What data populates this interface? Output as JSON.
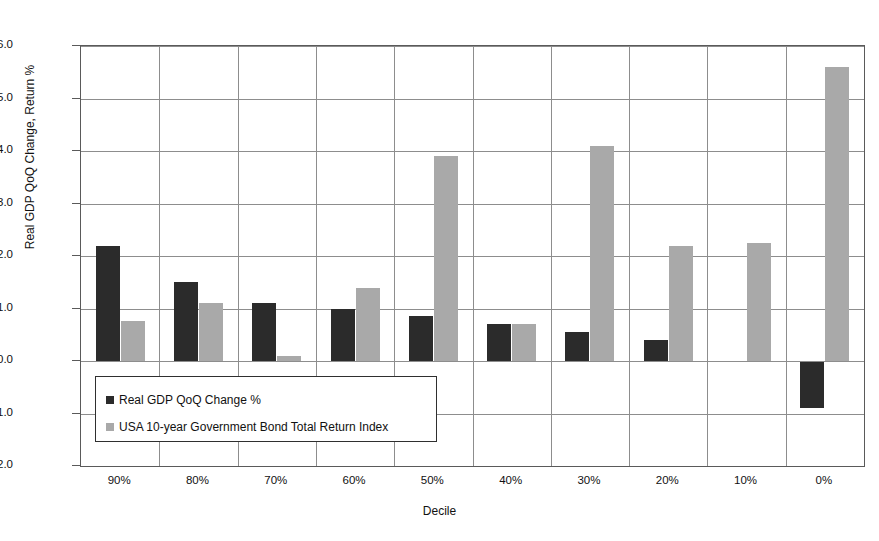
{
  "chart_data": {
    "type": "bar",
    "title": "",
    "xlabel": "Decile",
    "ylabel": "Real GDP QoQ Change, Return %",
    "categories": [
      "90%",
      "80%",
      "70%",
      "60%",
      "50%",
      "40%",
      "30%",
      "20%",
      "10%",
      "0%"
    ],
    "series": [
      {
        "name": "Real GDP QoQ Change %",
        "color": "#2b2b2b",
        "values": [
          2.2,
          1.5,
          1.1,
          1.0,
          0.85,
          0.7,
          0.55,
          0.4,
          0.0,
          -0.9
        ]
      },
      {
        "name": "USA 10-year Government Bond Total Return Index",
        "color": "#a9a9a9",
        "values": [
          0.77,
          1.1,
          0.1,
          1.4,
          3.9,
          0.7,
          4.1,
          2.2,
          2.25,
          5.6
        ]
      }
    ],
    "ylim": [
      -2.0,
      6.0
    ],
    "ytick_step": 1.0,
    "ytick_labels": [
      "6.0",
      "5.0",
      "4.0",
      "3.0",
      "2.0",
      "1.0",
      "0.0",
      "-1.0",
      "-2.0"
    ],
    "grid": true,
    "grid_axis": "both",
    "legend_position": "inside-lower-left"
  },
  "legend": {
    "entries": [
      {
        "label": "Real GDP QoQ Change %"
      },
      {
        "label": "USA 10-year Government Bond Total Return Index"
      }
    ]
  },
  "axes": {
    "y_title": "Real GDP QoQ Change, Return %",
    "x_title": "Decile"
  }
}
